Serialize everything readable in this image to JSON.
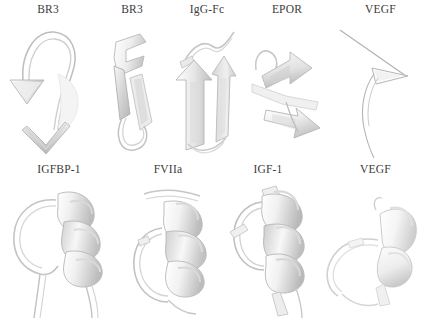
{
  "figure": {
    "background_color": "#ffffff",
    "label_color": "#3b3b3b",
    "ribbon_light": "#f2f2f2",
    "ribbon_mid": "#d8d8d8",
    "ribbon_dark": "#b4b4b4",
    "trace_color": "#9a9a9a",
    "rows": [
      {
        "name": "top-row",
        "panels": [
          {
            "label": "BR3",
            "structure": "beta-loop-with-down-arrow"
          },
          {
            "label": "BR3",
            "structure": "beta-hairpin-ribbon"
          },
          {
            "label": "IgG-Fc",
            "structure": "two-beta-strands-up-arrows"
          },
          {
            "label": "EPOR",
            "structure": "diagonal-beta-strands-arrows"
          },
          {
            "label": "VEGF",
            "structure": "thin-loop-trace-with-triangle"
          }
        ]
      },
      {
        "name": "bottom-row",
        "panels": [
          {
            "label": "IGFBP-1",
            "structure": "alpha-helix-with-loop"
          },
          {
            "label": "FVIIa",
            "structure": "alpha-helix-with-large-loop"
          },
          {
            "label": "IGF-1",
            "structure": "alpha-helix-coil-with-loop"
          },
          {
            "label": "VEGF",
            "structure": "short-helix-horseshoe-loop"
          }
        ]
      }
    ]
  }
}
